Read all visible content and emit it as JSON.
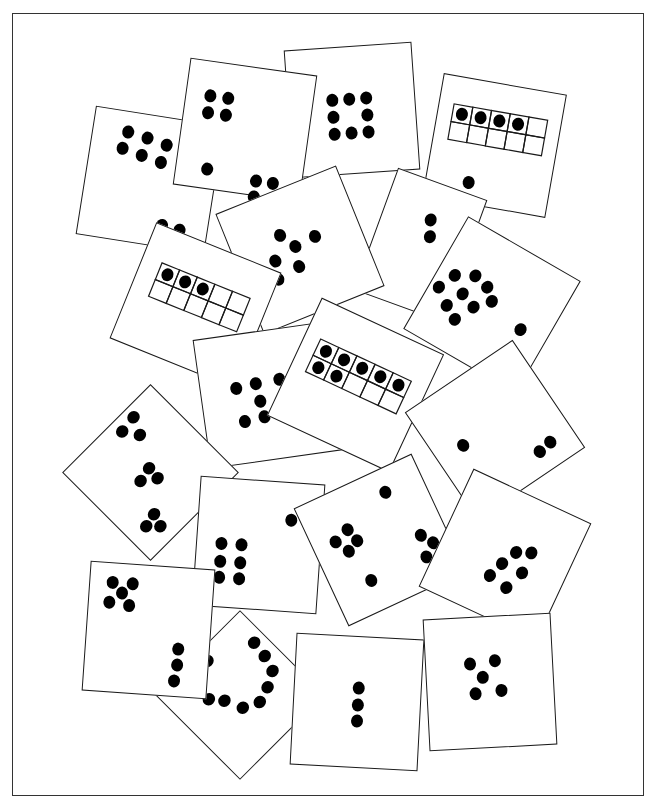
{
  "page": {
    "frame_color": "#333333",
    "card_border_color": "#1a1a1a",
    "dot_color": "#000000"
  },
  "cards": [
    {
      "id": "c-top-left-6-plus-2",
      "cx": 150,
      "cy": 180,
      "w": 130,
      "h": 130,
      "rot": 9,
      "total": 8,
      "type": "dots",
      "dots": [
        [
          -30,
          -45
        ],
        [
          -10,
          -42
        ],
        [
          10,
          -38
        ],
        [
          -33,
          -28
        ],
        [
          -13,
          -24
        ],
        [
          7,
          -20
        ],
        [
          18,
          42
        ],
        [
          36,
          44
        ]
      ]
    },
    {
      "id": "c-top-center-8-ring",
      "cx": 352,
      "cy": 110,
      "w": 128,
      "h": 128,
      "rot": -4,
      "total": 8,
      "type": "dots",
      "dots": [
        [
          -20,
          -12
        ],
        [
          -3,
          -12
        ],
        [
          14,
          -12
        ],
        [
          -20,
          5
        ],
        [
          14,
          5
        ],
        [
          -20,
          22
        ],
        [
          -3,
          22
        ],
        [
          14,
          22
        ]
      ]
    },
    {
      "id": "c-top-4-1-4",
      "cx": 245,
      "cy": 130,
      "w": 128,
      "h": 128,
      "rot": 8,
      "total": 9,
      "type": "dots",
      "dots": [
        [
          -40,
          -30
        ],
        [
          -22,
          -30
        ],
        [
          -40,
          -13
        ],
        [
          -22,
          -13
        ],
        [
          -33,
          43
        ],
        [
          17,
          48
        ],
        [
          34,
          48
        ],
        [
          17,
          64
        ],
        [
          34,
          64
        ]
      ]
    },
    {
      "id": "c-right-top-tenframe-4-plus-1",
      "cx": 494,
      "cy": 145,
      "w": 125,
      "h": 125,
      "rot": 10,
      "total": 5,
      "type": "tenframe",
      "frame": {
        "x": -48,
        "y": -35,
        "cw": 19,
        "ch": 18,
        "filled": [
          0,
          1,
          2,
          3
        ]
      },
      "dots": [
        [
          -20,
          40
        ]
      ]
    },
    {
      "id": "c-mid-2",
      "cx": 420,
      "cy": 245,
      "w": 95,
      "h": 130,
      "rot": 20,
      "total": 2,
      "type": "dots",
      "dots": [
        [
          0,
          -28
        ],
        [
          5,
          -12
        ]
      ]
    },
    {
      "id": "c-mid-6",
      "cx": 300,
      "cy": 250,
      "w": 130,
      "h": 130,
      "rot": -22,
      "total": 6,
      "type": "dots",
      "dots": [
        [
          -14,
          -22
        ],
        [
          -4,
          -6
        ],
        [
          -28,
          0
        ],
        [
          18,
          -8
        ],
        [
          -8,
          14
        ],
        [
          -32,
          18
        ]
      ]
    },
    {
      "id": "c-left-tenframe-3",
      "cx": 195,
      "cy": 305,
      "w": 135,
      "h": 125,
      "rot": 22,
      "total": 3,
      "type": "tenframe",
      "frame": {
        "x": -48,
        "y": -28,
        "cw": 19,
        "ch": 18,
        "filled": [
          0,
          1,
          2
        ]
      },
      "dots": []
    },
    {
      "id": "c-right-9-plus-1",
      "cx": 492,
      "cy": 305,
      "w": 130,
      "h": 130,
      "rot": 30,
      "total": 10,
      "type": "dots",
      "dots": [
        [
          -30,
          -18
        ],
        [
          -14,
          -14
        ],
        [
          -3,
          -4
        ],
        [
          -48,
          -8
        ],
        [
          -32,
          4
        ],
        [
          -16,
          10
        ],
        [
          -56,
          10
        ],
        [
          -40,
          22
        ],
        [
          -26,
          30
        ],
        [
          36,
          6
        ]
      ]
    },
    {
      "id": "c-center-6",
      "cx": 268,
      "cy": 395,
      "w": 135,
      "h": 130,
      "rot": -8,
      "total": 6,
      "type": "dots",
      "dots": [
        [
          -32,
          -12
        ],
        [
          -12,
          -14
        ],
        [
          12,
          -15
        ],
        [
          -10,
          4
        ],
        [
          -28,
          22
        ],
        [
          -8,
          20
        ]
      ]
    },
    {
      "id": "c-center-tenframe-7",
      "cx": 355,
      "cy": 385,
      "w": 135,
      "h": 130,
      "rot": 25,
      "total": 7,
      "type": "tenframe",
      "frame": {
        "x": -52,
        "y": -28,
        "cw": 20,
        "ch": 18,
        "filled": [
          0,
          1,
          2,
          3,
          4,
          5,
          6
        ]
      },
      "dots": []
    },
    {
      "id": "c-right-1-plus-2",
      "cx": 495,
      "cy": 430,
      "w": 130,
      "h": 130,
      "rot": -34,
      "total": 3,
      "type": "dots",
      "dots": [
        [
          -36,
          -6
        ],
        [
          24,
          42
        ],
        [
          38,
          40
        ]
      ]
    },
    {
      "id": "c-left-3-3-3",
      "cx": 150,
      "cy": 472,
      "w": 125,
      "h": 125,
      "rot": 45,
      "total": 9,
      "type": "dots",
      "dots": [
        [
          -52,
          -28
        ],
        [
          -50,
          -10
        ],
        [
          -35,
          -20
        ],
        [
          -5,
          -3
        ],
        [
          8,
          -2
        ],
        [
          -2,
          12
        ],
        [
          31,
          26
        ],
        [
          34,
          40
        ],
        [
          44,
          30
        ]
      ]
    },
    {
      "id": "c-center-1-plus-6",
      "cx": 258,
      "cy": 545,
      "w": 125,
      "h": 130,
      "rot": 4,
      "total": 7,
      "type": "dots",
      "dots": [
        [
          30,
          -28
        ],
        [
          -38,
          0
        ],
        [
          -18,
          0
        ],
        [
          -38,
          18
        ],
        [
          -18,
          18
        ],
        [
          -38,
          34
        ],
        [
          -18,
          34
        ]
      ]
    },
    {
      "id": "c-center-right-4-1-3",
      "cx": 380,
      "cy": 540,
      "w": 130,
      "h": 130,
      "rot": -25,
      "total": 8,
      "type": "dots",
      "dots": [
        [
          24,
          -42
        ],
        [
          -42,
          -18
        ],
        [
          -26,
          -24
        ],
        [
          -34,
          -4
        ],
        [
          -22,
          -10
        ],
        [
          -26,
          32
        ],
        [
          38,
          12
        ],
        [
          46,
          24
        ],
        [
          34,
          34
        ]
      ]
    },
    {
      "id": "c-right-6",
      "cx": 505,
      "cy": 555,
      "w": 130,
      "h": 130,
      "rot": 25,
      "total": 6,
      "type": "dots",
      "dots": [
        [
          8,
          -8
        ],
        [
          0,
          8
        ],
        [
          22,
          -14
        ],
        [
          22,
          8
        ],
        [
          -6,
          24
        ],
        [
          14,
          28
        ]
      ]
    },
    {
      "id": "c-bottom-arc-9",
      "cx": 240,
      "cy": 695,
      "w": 120,
      "h": 120,
      "rot": 45,
      "total": 9,
      "type": "dots",
      "dots": [
        [
          -28,
          -48
        ],
        [
          -11,
          -46
        ],
        [
          5,
          -41
        ],
        [
          13,
          -26
        ],
        [
          18,
          -10
        ],
        [
          10,
          6
        ],
        [
          -8,
          14
        ],
        [
          -20,
          24
        ],
        [
          -48,
          -2
        ]
      ]
    },
    {
      "id": "c-bottom-left-5-plus-3",
      "cx": 148,
      "cy": 630,
      "w": 125,
      "h": 130,
      "rot": 4,
      "total": 8,
      "type": "dots",
      "dots": [
        [
          -40,
          -46
        ],
        [
          -20,
          -46
        ],
        [
          -30,
          -36
        ],
        [
          -42,
          -26
        ],
        [
          -22,
          -24
        ],
        [
          30,
          16
        ],
        [
          30,
          32
        ],
        [
          28,
          48
        ]
      ]
    },
    {
      "id": "c-bottom-center-3",
      "cx": 357,
      "cy": 702,
      "w": 128,
      "h": 132,
      "rot": 3,
      "total": 3,
      "type": "dots",
      "dots": [
        [
          0,
          -15
        ],
        [
          0,
          2
        ],
        [
          0,
          18
        ]
      ]
    },
    {
      "id": "c-bottom-right-5",
      "cx": 490,
      "cy": 682,
      "w": 128,
      "h": 132,
      "rot": -3,
      "total": 5,
      "type": "dots",
      "dots": [
        [
          -20,
          -20
        ],
        [
          5,
          -22
        ],
        [
          -8,
          -6
        ],
        [
          -16,
          10
        ],
        [
          10,
          8
        ]
      ]
    }
  ]
}
